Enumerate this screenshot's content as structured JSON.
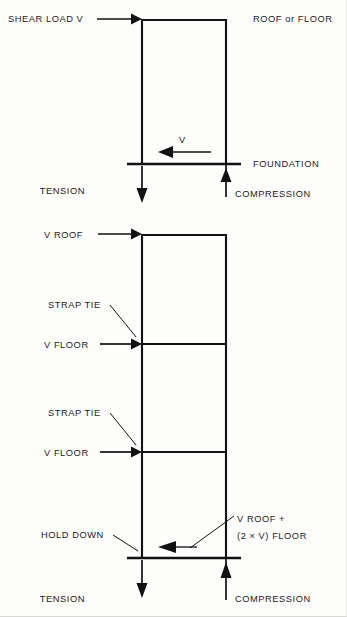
{
  "figure": {
    "background_color": "#fdfdfc",
    "ink_color": "#111111"
  },
  "diagrams": [
    {
      "id": "single-story",
      "labels": {
        "shear_load": "SHEAR LOAD V",
        "roof_or_floor": "ROOF or FLOOR",
        "v_tag": "V",
        "foundation": "FOUNDATION",
        "tension": "TENSION",
        "compression": "COMPRESSION"
      }
    },
    {
      "id": "multi-story",
      "labels": {
        "v_roof": "V ROOF",
        "strap_tie_upper": "STRAP TIE",
        "v_floor_upper": "V FLOOR",
        "strap_tie_lower": "STRAP TIE",
        "v_floor_lower": "V FLOOR",
        "hold_down": "HOLD DOWN",
        "cumulative_shear_line1": "V ROOF +",
        "cumulative_shear_line2": "(2 × V) FLOOR",
        "tension": "TENSION",
        "compression": "COMPRESSION"
      }
    }
  ],
  "icons": {
    "arrow_right": "arrow-right-icon",
    "arrow_left": "arrow-left-icon",
    "arrow_down": "arrow-down-icon",
    "arrow_up": "arrow-up-icon",
    "leader": "leader-line-icon"
  }
}
